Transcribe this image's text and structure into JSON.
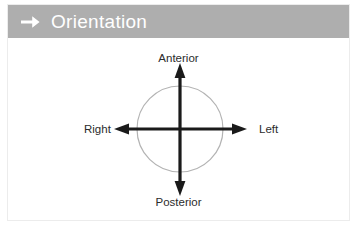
{
  "slide": {
    "header": {
      "icon": "right-arrow-icon",
      "title": "Orientation",
      "bar_color": "#aeaeae",
      "title_color": "#ffffff"
    },
    "diagram": {
      "type": "orientation-compass",
      "circle_color": "#b3b3b3",
      "axis_color": "#1a1a1a",
      "center": {
        "x": 172,
        "y": 91
      },
      "circle_radius": 43,
      "labels": {
        "top": "Anterior",
        "bottom": "Posterior",
        "left": "Right",
        "right": "Left"
      },
      "label_color": "#2c2c2c"
    }
  }
}
